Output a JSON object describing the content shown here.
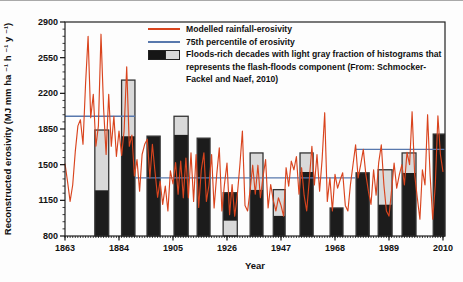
{
  "colors": {
    "red_line": "#d9441e",
    "blue_line": "#5878ad",
    "dark_bar": "#1c1c1c",
    "light_bar": "#d9d9d9",
    "bar_outline": "#333333",
    "axis": "#111111"
  },
  "legend": {
    "items": [
      {
        "type": "line",
        "color": "#d9441e",
        "label": "Modelled rainfall-erosivity"
      },
      {
        "type": "line",
        "color": "#5878ad",
        "label": "75th percentile of erosivity"
      },
      {
        "type": "bar",
        "label": "Floods-rich decades with light gray fraction of histograms that represents the flash-floods component (From: Schmocker-Fackel and Naef, 2010)"
      }
    ]
  },
  "axes": {
    "y_label": "Reconstructed erosivity (MJ mm ha ⁻¹ h ⁻¹ y ⁻¹)",
    "x_label": "Year",
    "y_ticks": [
      800,
      1150,
      1500,
      1850,
      2200,
      2550,
      2900
    ],
    "x_ticks": [
      1863,
      1884,
      1905,
      1926,
      1947,
      1968,
      1989,
      2010
    ],
    "y_range": [
      800,
      2900
    ],
    "x_range": [
      1863,
      2011
    ]
  },
  "chart_data": {
    "type": "line+bar",
    "title": "",
    "xlabel": "Year",
    "ylabel": "Reconstructed erosivity (MJ mm ha-1 h-1 y-1)",
    "ylim": [
      800,
      2900
    ],
    "xlim": [
      1863,
      2011
    ],
    "red_series": {
      "name": "Modelled rainfall-erosivity",
      "x_start": 1863,
      "x_step": 1,
      "values": [
        1510,
        1330,
        1140,
        1300,
        1630,
        1880,
        1940,
        1700,
        2300,
        2760,
        1960,
        2190,
        1680,
        1880,
        2780,
        2050,
        1600,
        2190,
        1680,
        1975,
        1580,
        1830,
        1590,
        1830,
        2460,
        1680,
        1790,
        1390,
        1550,
        1240,
        1600,
        1700,
        1750,
        1370,
        1700,
        1430,
        1180,
        1340,
        1110,
        1290,
        1045,
        1440,
        1310,
        1520,
        1210,
        1535,
        1175,
        1565,
        1175,
        1615,
        1140,
        1600,
        1080,
        1450,
        1615,
        1140,
        1300,
        1600,
        1075,
        1400,
        1665,
        1045,
        1300,
        1515,
        1010,
        1305,
        995,
        1200,
        1500,
        1830,
        1100,
        1045,
        1250,
        1495,
        1210,
        1495,
        1175,
        1380,
        1550,
        1075,
        1305,
        1150,
        1045,
        1175,
        1100,
        995,
        1470,
        1290,
        1535,
        1450,
        1580,
        1210,
        1470,
        1200,
        1045,
        1350,
        1680,
        1300,
        1600,
        1240,
        1550,
        2010,
        1140,
        1370,
        1045,
        1405,
        1270,
        1350,
        1420,
        1100,
        1045,
        1300,
        1500,
        1695,
        1370,
        1500,
        1650,
        1400,
        1240,
        1110,
        1450,
        1200,
        1520,
        1695,
        1300,
        1045,
        995,
        1250,
        1515,
        1270,
        1400,
        1500,
        1300,
        1620,
        1500,
        2020,
        1400,
        1175,
        965,
        1450,
        1300,
        1990,
        1400,
        965,
        1300,
        1980,
        1600,
        1430
      ]
    },
    "percentile_segments": [
      {
        "from_year": 1863,
        "to_year": 1890.2,
        "value": 1975
      },
      {
        "from_year": 1890.2,
        "to_year": 1976,
        "value": 1370
      },
      {
        "from_year": 1976,
        "to_year": 2011,
        "value": 1650
      }
    ],
    "bars": [
      {
        "decade": "1870s",
        "from_year": 1874.6,
        "to_year": 1880.0,
        "segments": [
          {
            "color": "dark",
            "from": 800,
            "to": 1250
          },
          {
            "color": "light",
            "from": 1250,
            "to": 1840
          }
        ]
      },
      {
        "decade": "1880s",
        "from_year": 1885.0,
        "to_year": 1890.2,
        "segments": [
          {
            "color": "dark",
            "from": 800,
            "to": 1780
          },
          {
            "color": "light",
            "from": 1780,
            "to": 2330
          }
        ]
      },
      {
        "decade": "1890s",
        "from_year": 1894.9,
        "to_year": 1900.0,
        "segments": [
          {
            "color": "dark",
            "from": 800,
            "to": 1780
          }
        ]
      },
      {
        "decade": "1900s",
        "from_year": 1905.4,
        "to_year": 1910.9,
        "segments": [
          {
            "color": "dark",
            "from": 800,
            "to": 1795
          },
          {
            "color": "light",
            "from": 1795,
            "to": 1975
          }
        ]
      },
      {
        "decade": "1910s",
        "from_year": 1914.4,
        "to_year": 1919.4,
        "segments": [
          {
            "color": "dark",
            "from": 800,
            "to": 1760
          }
        ]
      },
      {
        "decade": "1920s",
        "from_year": 1924.5,
        "to_year": 1930.0,
        "segments": [
          {
            "color": "light",
            "from": 800,
            "to": 950
          },
          {
            "color": "dark",
            "from": 950,
            "to": 1225
          }
        ]
      },
      {
        "decade": "1930s",
        "from_year": 1935.0,
        "to_year": 1940.0,
        "segments": [
          {
            "color": "dark",
            "from": 800,
            "to": 1255
          },
          {
            "color": "light",
            "from": 1255,
            "to": 1615
          }
        ]
      },
      {
        "decade": "1940s",
        "from_year": 1944.0,
        "to_year": 1948.6,
        "segments": [
          {
            "color": "dark",
            "from": 800,
            "to": 1000
          },
          {
            "color": "light",
            "from": 1000,
            "to": 1255
          }
        ]
      },
      {
        "decade": "1950s",
        "from_year": 1954.4,
        "to_year": 1959.5,
        "segments": [
          {
            "color": "dark",
            "from": 800,
            "to": 1430
          },
          {
            "color": "light",
            "from": 1430,
            "to": 1615
          }
        ]
      },
      {
        "decade": "1960s",
        "from_year": 1966.1,
        "to_year": 1971.1,
        "segments": [
          {
            "color": "dark",
            "from": 800,
            "to": 1075
          }
        ]
      },
      {
        "decade": "1970s",
        "from_year": 1976.2,
        "to_year": 1981.3,
        "segments": [
          {
            "color": "dark",
            "from": 800,
            "to": 1420
          }
        ]
      },
      {
        "decade": "1980s",
        "from_year": 1984.8,
        "to_year": 1990.2,
        "segments": [
          {
            "color": "dark",
            "from": 800,
            "to": 1110
          },
          {
            "color": "light",
            "from": 1110,
            "to": 1450
          }
        ]
      },
      {
        "decade": "1990s",
        "from_year": 1994.1,
        "to_year": 1999.5,
        "segments": [
          {
            "color": "dark",
            "from": 800,
            "to": 1420
          },
          {
            "color": "light",
            "from": 1420,
            "to": 1615
          }
        ]
      },
      {
        "decade": "2000s",
        "from_year": 2006.2,
        "to_year": 2011.0,
        "segments": [
          {
            "color": "dark",
            "from": 800,
            "to": 1800
          }
        ]
      }
    ]
  }
}
